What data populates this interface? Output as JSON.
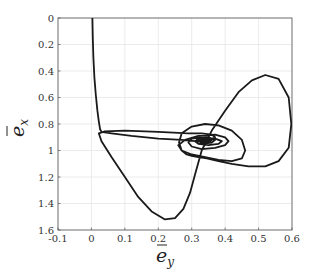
{
  "chart_data": {
    "type": "line",
    "title": "",
    "xlabel": "ē_y",
    "ylabel": "ē_x",
    "xlabel_main": "e",
    "xlabel_sub": "y",
    "ylabel_main": "e",
    "ylabel_sub": "x",
    "xlim": [
      -0.1,
      0.6
    ],
    "ylim": [
      0,
      1.6
    ],
    "y_reversed": true,
    "grid": true,
    "legend": null,
    "x_ticks": [
      -0.1,
      0,
      0.1,
      0.2,
      0.3,
      0.4,
      0.5,
      0.6
    ],
    "x_tick_labels": [
      "-0.1",
      "0",
      "0.1",
      "0.2",
      "0.3",
      "0.4",
      "0.5",
      "0.6"
    ],
    "y_ticks": [
      0,
      0.2,
      0.4,
      0.6,
      0.8,
      1,
      1.2,
      1.4,
      1.6
    ],
    "y_tick_labels": [
      "0",
      "0.2",
      "0.4",
      "0.6",
      "0.8",
      "1",
      "1.2",
      "1.4",
      "1.6"
    ],
    "line_color": "#1a1a1a",
    "grid_color": "#e3e3e3",
    "axis_color": "#555555",
    "series": [
      {
        "name": "trajectory",
        "x": [
          0.003,
          0.004,
          0.006,
          0.009,
          0.013,
          0.018,
          0.022,
          0.026,
          0.03,
          0.06,
          0.12,
          0.2,
          0.27,
          0.31,
          0.34,
          0.36,
          0.37,
          0.36,
          0.33,
          0.29,
          0.2,
          0.1,
          0.04,
          0.022,
          0.03,
          0.06,
          0.1,
          0.14,
          0.18,
          0.22,
          0.25,
          0.275,
          0.295,
          0.31,
          0.33,
          0.36,
          0.4,
          0.44,
          0.48,
          0.52,
          0.56,
          0.59,
          0.598,
          0.59,
          0.56,
          0.52,
          0.47,
          0.42,
          0.38,
          0.345,
          0.32,
          0.3,
          0.285,
          0.27,
          0.262,
          0.27,
          0.3,
          0.34,
          0.38,
          0.42,
          0.45,
          0.46,
          0.45,
          0.42,
          0.38,
          0.34,
          0.3,
          0.27,
          0.26,
          0.28,
          0.32,
          0.37,
          0.4,
          0.41,
          0.4,
          0.37,
          0.33,
          0.3,
          0.29,
          0.3,
          0.33,
          0.37,
          0.39,
          0.38,
          0.35,
          0.32,
          0.31,
          0.32,
          0.35,
          0.37,
          0.36,
          0.33,
          0.315,
          0.32,
          0.345,
          0.36,
          0.35,
          0.33,
          0.325,
          0.335,
          0.345,
          0.34
        ],
        "y": [
          0.0,
          0.15,
          0.3,
          0.45,
          0.58,
          0.7,
          0.78,
          0.84,
          0.86,
          0.87,
          0.89,
          0.91,
          0.92,
          0.93,
          0.93,
          0.92,
          0.9,
          0.88,
          0.87,
          0.87,
          0.86,
          0.85,
          0.855,
          0.87,
          0.93,
          1.05,
          1.2,
          1.35,
          1.46,
          1.52,
          1.51,
          1.44,
          1.32,
          1.18,
          1.0,
          0.85,
          0.7,
          0.56,
          0.47,
          0.43,
          0.46,
          0.6,
          0.8,
          0.98,
          1.08,
          1.12,
          1.12,
          1.1,
          1.08,
          1.06,
          1.05,
          1.04,
          1.03,
          1.0,
          0.94,
          0.87,
          0.82,
          0.8,
          0.81,
          0.85,
          0.92,
          1.0,
          1.06,
          1.08,
          1.07,
          1.05,
          1.03,
          1.0,
          0.96,
          0.92,
          0.89,
          0.88,
          0.9,
          0.93,
          0.96,
          0.98,
          0.99,
          0.97,
          0.94,
          0.91,
          0.9,
          0.91,
          0.93,
          0.95,
          0.96,
          0.95,
          0.93,
          0.91,
          0.9,
          0.92,
          0.94,
          0.95,
          0.94,
          0.92,
          0.91,
          0.92,
          0.94,
          0.94,
          0.93,
          0.92,
          0.925,
          0.93
        ]
      }
    ]
  }
}
